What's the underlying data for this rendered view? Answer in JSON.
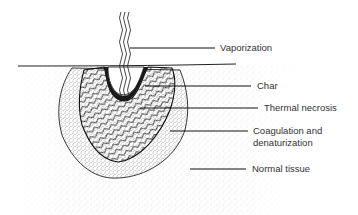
{
  "diagram": {
    "labels": [
      {
        "id": "vaporization",
        "text": "Vaporization"
      },
      {
        "id": "char",
        "text": "Char"
      },
      {
        "id": "thermal-necrosis",
        "text": "Thermal necrosis"
      },
      {
        "id": "coagulation",
        "text": "Coagulation and",
        "text2": "denaturization"
      },
      {
        "id": "normal-tissue",
        "text": "Normal tissue"
      }
    ],
    "colors": {
      "ink": "#222222",
      "background": "#ffffff"
    }
  }
}
